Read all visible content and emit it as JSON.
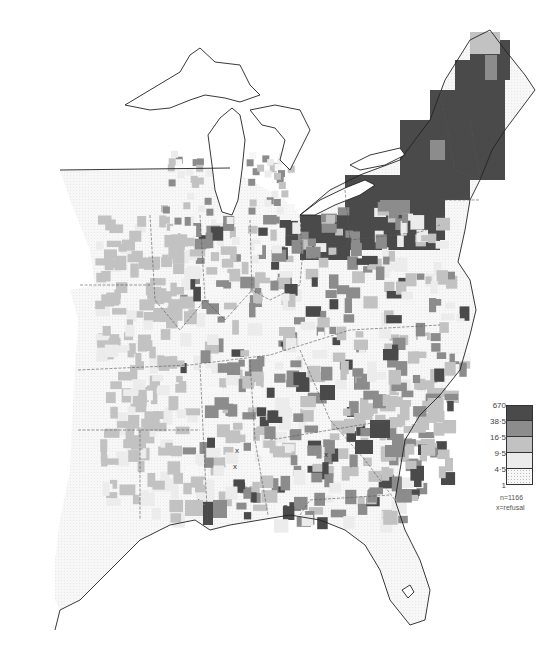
{
  "map": {
    "region": "Eastern United States",
    "colors": {
      "class5": "#4a4a4a",
      "class4": "#8c8c8c",
      "class3": "#c2c2c2",
      "class2": "#ececec",
      "class1": "#f7f7f7",
      "outline": "#222222"
    }
  },
  "legend": {
    "breaks": [
      "670",
      "38·5",
      "16·5",
      "9·5",
      "4·5",
      "1"
    ],
    "classes": [
      {
        "label_top": "670",
        "label_bottom": "38·5",
        "color": "#4a4a4a"
      },
      {
        "label_top": "38·5",
        "label_bottom": "16·5",
        "color": "#8c8c8c"
      },
      {
        "label_top": "16·5",
        "label_bottom": "9·5",
        "color": "#c2c2c2"
      },
      {
        "label_top": "9·5",
        "label_bottom": "4·5",
        "color": "#ececec"
      },
      {
        "label_top": "4·5",
        "label_bottom": "1",
        "color": "#f7f7f7"
      }
    ],
    "n_label": "n=1166",
    "refusal_label": "x=refusal"
  },
  "refusal_marker": "x"
}
